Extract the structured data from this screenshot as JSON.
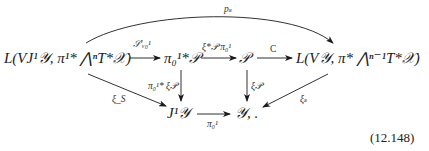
{
  "diagram": {
    "type": "commutative-diagram",
    "nodes": {
      "left": "L(VJ¹𝒴, π¹* ⋀ⁿT*𝒳)",
      "pi_pullback_P": "π₀¹*𝒫",
      "P": "𝒫",
      "right": "L(V𝒴, π* ⋀ⁿ⁻¹T*𝒳)",
      "J1Y": "J¹𝒴",
      "Y": "𝒴, ."
    },
    "arrows": {
      "top_curve": "pₛ",
      "left_to_pullback": "𝒮′ᵥ₀¹",
      "pullback_to_P": "ξ*𝒫 π₀¹",
      "P_to_right": "C",
      "left_to_J1Y": "ξ_S",
      "pullback_to_J1Y": "π₀¹* ξ𝒫",
      "P_to_Y": "ξ𝒫",
      "right_to_Y": "ξₛ",
      "J1Y_to_Y": "π₀¹"
    },
    "equation_number": "(12.148)"
  },
  "colors": {
    "ink": "#1a1a1a",
    "label": "#333333",
    "background": "#ffffff"
  }
}
